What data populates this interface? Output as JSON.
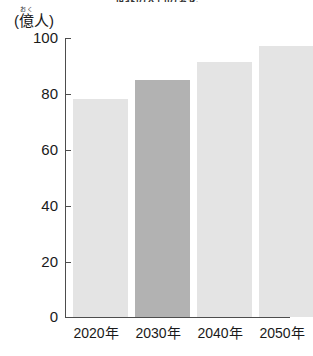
{
  "chart_data": {
    "type": "bar",
    "title": "世界の人口の変化",
    "categories": [
      "2020年",
      "2030年",
      "2040年",
      "2050年"
    ],
    "values": [
      78,
      85,
      91.5,
      97
    ],
    "series": [
      {
        "name": "世界人口",
        "values": [
          78,
          85,
          91.5,
          97
        ]
      }
    ],
    "xlabel": "",
    "ylabel": "(億人)",
    "ylabel_base": "(億人)",
    "ylabel_kanji": "億",
    "ylabel_ruby": "おく",
    "ylabel_prefix": "(",
    "ylabel_suffix": "人)",
    "ylim": [
      0,
      100
    ],
    "ytick_labels": [
      "100",
      "80",
      "60",
      "40",
      "20",
      "0"
    ],
    "ytick_values": [
      100,
      80,
      60,
      40,
      20,
      0
    ],
    "grid": false,
    "legend": "none",
    "highlight_index": 1,
    "colors": {
      "bar_normal": "#e4e4e4",
      "bar_highlight": "#b2b2b2",
      "axis": "#4d4d4d",
      "text": "#1a1a1a",
      "background": "#ffffff"
    }
  }
}
